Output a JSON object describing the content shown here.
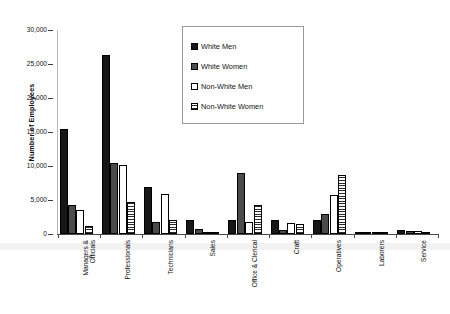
{
  "chart_data": {
    "type": "bar",
    "title": "",
    "xlabel": "",
    "ylabel": "Number of Employees",
    "ylim": [
      0,
      30000
    ],
    "ytick_labels": [
      "30,000",
      "25,000",
      "20,000",
      "15,000",
      "10,000",
      "5,000",
      "0"
    ],
    "ytick_values": [
      30000,
      25000,
      20000,
      15000,
      10000,
      5000,
      0
    ],
    "grid": false,
    "legend_position": "top-center",
    "categories": [
      "Managers & Officials",
      "Professionals",
      "Technicians",
      "Sales",
      "Office & Clerical",
      "Craft",
      "Operatives",
      "Laborers",
      "Service"
    ],
    "category_lines": [
      [
        "Managers &",
        "Officials"
      ],
      [
        "Professionals"
      ],
      [
        "Technicians"
      ],
      [
        "Sales"
      ],
      [
        "Office & Clerical"
      ],
      [
        "Craft"
      ],
      [
        "Operatives"
      ],
      [
        "Laborers"
      ],
      [
        "Service"
      ]
    ],
    "series": [
      {
        "name": "White Men",
        "swatch": "solid-black",
        "color": "#171717",
        "values": [
          15500,
          26300,
          6900,
          2000,
          2000,
          2000,
          2000,
          200,
          600
        ]
      },
      {
        "name": "White Women",
        "swatch": "dark-dotted",
        "color": "#4b4b4b",
        "values": [
          4200,
          10400,
          1800,
          700,
          9000,
          600,
          3000,
          150,
          500
        ]
      },
      {
        "name": "Non-White Men",
        "swatch": "white-outline",
        "color": "#ffffff",
        "values": [
          3500,
          10200,
          5900,
          250,
          1800,
          1600,
          5700,
          200,
          400
        ]
      },
      {
        "name": "Non-White Women",
        "swatch": "horizontal-hatch",
        "color": "#ffffff",
        "values": [
          1200,
          4700,
          2100,
          150,
          4300,
          1500,
          8700,
          180,
          350
        ]
      }
    ]
  },
  "legend": {
    "items": [
      {
        "label": "White Men"
      },
      {
        "label": "White Women"
      },
      {
        "label": "Non-White Men"
      },
      {
        "label": "Non-White Women"
      }
    ]
  }
}
